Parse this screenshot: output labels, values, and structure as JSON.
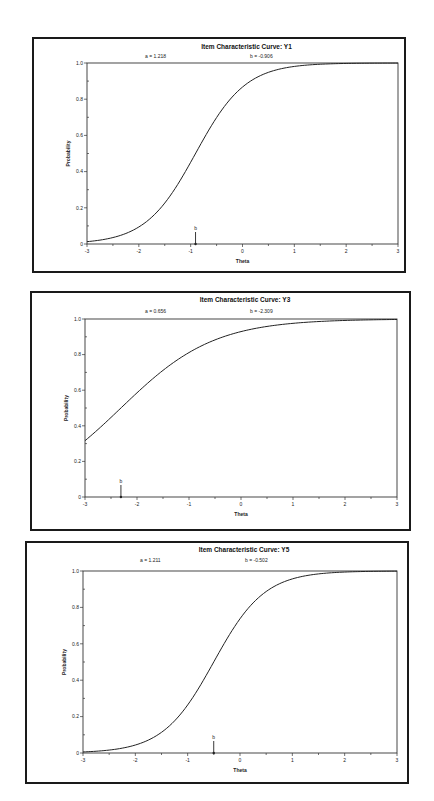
{
  "chart_data": [
    {
      "type": "line",
      "title": "Item Characteristic Curve: Y1",
      "params": {
        "a_label": "a =  1.218",
        "b_label": "b = -0.906",
        "a": 1.218,
        "b": -0.906
      },
      "xlabel": "Theta",
      "ylabel": "Probability",
      "xlim": [
        -3,
        3
      ],
      "ylim": [
        0,
        1
      ],
      "x_ticks": [
        "-3",
        "-2",
        "-1",
        "0",
        "1",
        "2",
        "3"
      ],
      "y_ticks": [
        "0",
        "0.2",
        "0.4",
        "0.6",
        "0.8",
        "1.0"
      ],
      "b_marker": {
        "label": "b",
        "x": -0.906
      },
      "grid": false,
      "series": [
        {
          "name": "ICC Y1",
          "x": [
            -3,
            -2.5,
            -2,
            -1.5,
            -1,
            -0.906,
            -0.5,
            0,
            0.5,
            1,
            1.5,
            2,
            2.5,
            3
          ],
          "values": [
            0.013,
            0.024,
            0.093,
            0.223,
            0.476,
            0.5,
            0.698,
            0.868,
            0.945,
            0.981,
            0.993,
            0.998,
            0.999,
            1.0
          ]
        }
      ]
    },
    {
      "type": "line",
      "title": "Item Characteristic Curve: Y3",
      "params": {
        "a_label": "a =  0.656",
        "b_label": "b = -2.309",
        "a": 0.656,
        "b": -2.309
      },
      "xlabel": "Theta",
      "ylabel": "Probability",
      "xlim": [
        -3,
        3
      ],
      "ylim": [
        0,
        1
      ],
      "x_ticks": [
        "-3",
        "-2",
        "-1",
        "0",
        "1",
        "2",
        "3"
      ],
      "y_ticks": [
        "0",
        "0.2",
        "0.4",
        "0.6",
        "0.8",
        "1.0"
      ],
      "b_marker": {
        "label": "b",
        "x": -2.309
      },
      "grid": false,
      "series": [
        {
          "name": "ICC Y3",
          "x": [
            -3,
            -2.5,
            -2,
            -1.5,
            -1,
            -0.5,
            0,
            0.5,
            1,
            1.5,
            2,
            2.5,
            3
          ],
          "values": [
            0.316,
            0.447,
            0.586,
            0.712,
            0.814,
            0.887,
            0.933,
            0.962,
            0.978,
            0.988,
            0.993,
            0.996,
            0.998
          ]
        }
      ]
    },
    {
      "type": "line",
      "title": "Item Characteristic Curve: Y5",
      "params": {
        "a_label": "a =  1.211",
        "b_label": "b = -0.502",
        "a": 1.211,
        "b": -0.502
      },
      "xlabel": "Theta",
      "ylabel": "Probability",
      "xlim": [
        -3,
        3
      ],
      "ylim": [
        0,
        1
      ],
      "x_ticks": [
        "-3",
        "-2",
        "-1",
        "0",
        "1",
        "2",
        "3"
      ],
      "y_ticks": [
        "0",
        "0.2",
        "0.4",
        "0.6",
        "0.8",
        "1.0"
      ],
      "b_marker": {
        "label": "b",
        "x": -0.502
      },
      "grid": false,
      "series": [
        {
          "name": "ICC Y5",
          "x": [
            -3,
            -2.5,
            -2,
            -1.5,
            -1,
            -0.502,
            0,
            0.5,
            1,
            1.5,
            2,
            2.5,
            3
          ],
          "values": [
            0.006,
            0.016,
            0.043,
            0.114,
            0.265,
            0.5,
            0.737,
            0.886,
            0.955,
            0.983,
            0.994,
            0.998,
            0.999
          ]
        }
      ]
    }
  ],
  "charts": [
    {
      "title": "Item Characteristic Curve: Y1",
      "a_label": "a =  1.218",
      "b_label": "b = -0.906",
      "xlabel": "Theta",
      "ylabel": "Probability",
      "b_marker_label": "b"
    },
    {
      "title": "Item Characteristic Curve: Y3",
      "a_label": "a =  0.656",
      "b_label": "b = -2.309",
      "xlabel": "Theta",
      "ylabel": "Probability",
      "b_marker_label": "b"
    },
    {
      "title": "Item Characteristic Curve: Y5",
      "a_label": "a =  1.211",
      "b_label": "b = -0.502",
      "xlabel": "Theta",
      "ylabel": "Probability",
      "b_marker_label": "b"
    }
  ],
  "layout": [
    {
      "frame": [
        32,
        37,
        374,
        236
      ],
      "plot": [
        87,
        63,
        398,
        244
      ],
      "title_y": 49,
      "param_y": 58,
      "a_x": 145,
      "b_x": 250
    },
    {
      "frame": [
        30,
        291,
        381,
        240
      ],
      "plot": [
        85,
        319,
        397,
        497
      ],
      "title_y": 302,
      "param_y": 313,
      "a_x": 145,
      "b_x": 250
    },
    {
      "frame": [
        25,
        541,
        384,
        243
      ],
      "plot": [
        83,
        571,
        397,
        753
      ],
      "title_y": 552,
      "param_y": 562,
      "a_x": 140,
      "b_x": 245
    }
  ],
  "style": {
    "curve_color": "#222222",
    "axis_color": "#333333",
    "frame_color": "#1a1a1a"
  }
}
